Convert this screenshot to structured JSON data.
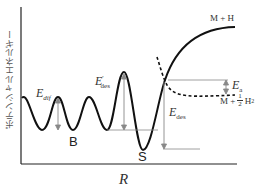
{
  "axes": {
    "y_label": "ポテンシャルエネルギー",
    "x_label": "R"
  },
  "labels": {
    "e_dif": {
      "main": "E",
      "sub": "dif"
    },
    "e_des_prime": {
      "main": "E",
      "sup": "'",
      "sub": "des"
    },
    "e_des": {
      "main": "E",
      "sub": "des"
    },
    "e_a": {
      "main": "E",
      "sub": "a"
    },
    "site_b": "B",
    "site_s": "S",
    "state_m_h": "M + H",
    "state_m_h2": {
      "prefix": "M +",
      "frac_num": "1",
      "frac_den": "2",
      "suffix": "H",
      "suffix_sub": "2"
    }
  },
  "colors": {
    "curve": "#111111",
    "arrow": "#888888",
    "text": "#333333"
  }
}
